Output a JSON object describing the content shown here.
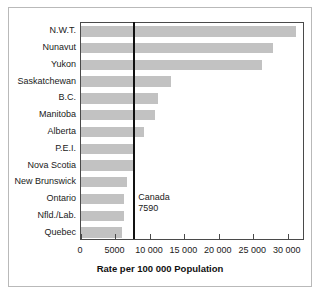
{
  "chart_data": {
    "type": "bar",
    "orientation": "horizontal",
    "title": "",
    "xlabel": "Rate per 100 000 Population",
    "ylabel": "",
    "xlim": [
      0,
      32500
    ],
    "grid": false,
    "legend": null,
    "categories": [
      "N.W.T.",
      "Nunavut",
      "Yukon",
      "Saskatchewan",
      "B.C.",
      "Manitoba",
      "Alberta",
      "P.E.I.",
      "Nova Scotia",
      "New Brunswick",
      "Ontario",
      "Nfld./Lab.",
      "Quebec"
    ],
    "values": [
      31200,
      27900,
      26200,
      13100,
      11200,
      10800,
      9100,
      7800,
      7800,
      6700,
      6300,
      6200,
      5900
    ],
    "tick_values": [
      0,
      5000,
      10000,
      15000,
      20000,
      25000,
      30000
    ],
    "tick_labels": [
      "0",
      "5000",
      "10 000",
      "15 000",
      "20 000",
      "25 000",
      "30 000"
    ],
    "reference_line": {
      "name": "Canada",
      "value": 7590,
      "label_name": "Canada",
      "label_value": "7590"
    },
    "colors": {
      "bar": "#c2c2c2",
      "axis": "#4a4a4a",
      "reference_line": "#111111",
      "text": "#1a1a1a",
      "background": "#ffffff",
      "figure_border": "#b9b9b9"
    }
  }
}
